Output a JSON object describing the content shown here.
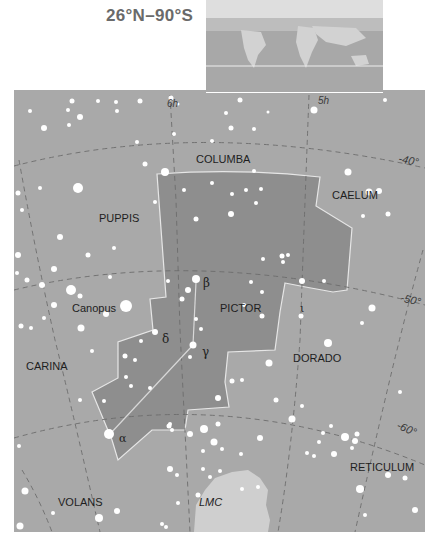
{
  "header": {
    "range_title": "26°N–90°S"
  },
  "colors": {
    "sky": "#a9a9a9",
    "constellation_fill": "#8e8e8e",
    "boundary": "#e6e6e6",
    "grid": "#6c6c6c",
    "stars": "#ffffff",
    "lmc": "#cfcfcf",
    "inset_ocean": "#a8a8a8",
    "inset_land": "#d2d2d2",
    "inset_sky": "#dedede"
  },
  "grid_labels": {
    "ra_6h": "6h",
    "ra_5h": "5h",
    "dec_40": "-40°",
    "dec_50": "-50°",
    "dec_60": "-60°"
  },
  "constellations": {
    "columba": "COLUMBA",
    "caelum": "CAELUM",
    "puppis": "PUPPIS",
    "pictor": "PICTOR",
    "carina": "CARINA",
    "dorado": "DORADO",
    "volans": "VOLANS",
    "reticulum": "RETICULUM"
  },
  "features": {
    "canopus": "Canopus",
    "lmc": "LMC"
  },
  "star_labels": {
    "alpha": "α",
    "beta": "β",
    "gamma": "γ",
    "delta": "δ",
    "iota": "ι"
  }
}
